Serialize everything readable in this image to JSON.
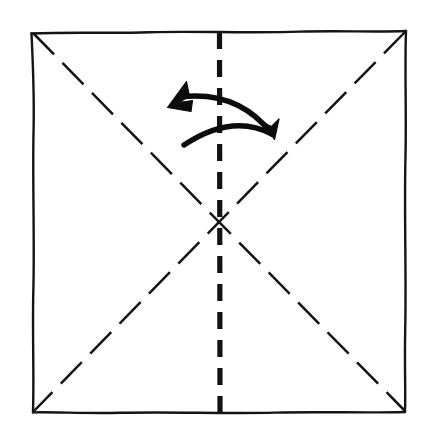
{
  "figure": {
    "kind": "origami-instruction-diagram",
    "background_color": "#ffffff",
    "ink_color": "#141414",
    "canvas": {
      "width": 428,
      "height": 429
    }
  },
  "sheet": {
    "name": "paper-square",
    "stroke_color": "#141414",
    "stroke_width": 2.4,
    "style": "solid hand-drawn",
    "corners": {
      "top_left": [
        31,
        33
      ],
      "top_right": [
        406,
        31
      ],
      "bottom_right": [
        405,
        412
      ],
      "bottom_left": [
        33,
        412
      ]
    }
  },
  "creases": [
    {
      "name": "diagonal-crease-tl-br",
      "style": "dashed",
      "stroke_width": 2.5,
      "dash": "30 12",
      "from": [
        33,
        33
      ],
      "to": [
        405,
        411
      ]
    },
    {
      "name": "diagonal-crease-tr-bl",
      "style": "dashed",
      "stroke_width": 2.5,
      "dash": "30 12",
      "from": [
        405,
        32
      ],
      "to": [
        34,
        411
      ]
    },
    {
      "name": "vertical-crease-center",
      "style": "dashed-bold",
      "stroke_width": 5.2,
      "dash": "17 11",
      "from": [
        219,
        32
      ],
      "to": [
        220,
        412
      ]
    }
  ],
  "center_point": {
    "name": "crease-intersection",
    "x": 219,
    "y": 222
  },
  "fold_arrow": {
    "name": "fold-unfold-arrow",
    "type": "double-headed-curved-arrow",
    "meaning": "fold along vertical center line and unfold",
    "stroke_color": "#0c0c0c",
    "upper_arc": {
      "start": [
        180,
        97
      ],
      "control": [
        238,
        90
      ],
      "end": [
        272,
        134
      ]
    },
    "lower_arc": {
      "start": [
        184,
        145
      ],
      "control": [
        232,
        113
      ],
      "end": [
        272,
        134
      ]
    },
    "left_arrow_tip": [
      168,
      107
    ],
    "right_arrow_tip": [
      274,
      137
    ]
  },
  "labels": {
    "caption": "",
    "step_number": ""
  }
}
